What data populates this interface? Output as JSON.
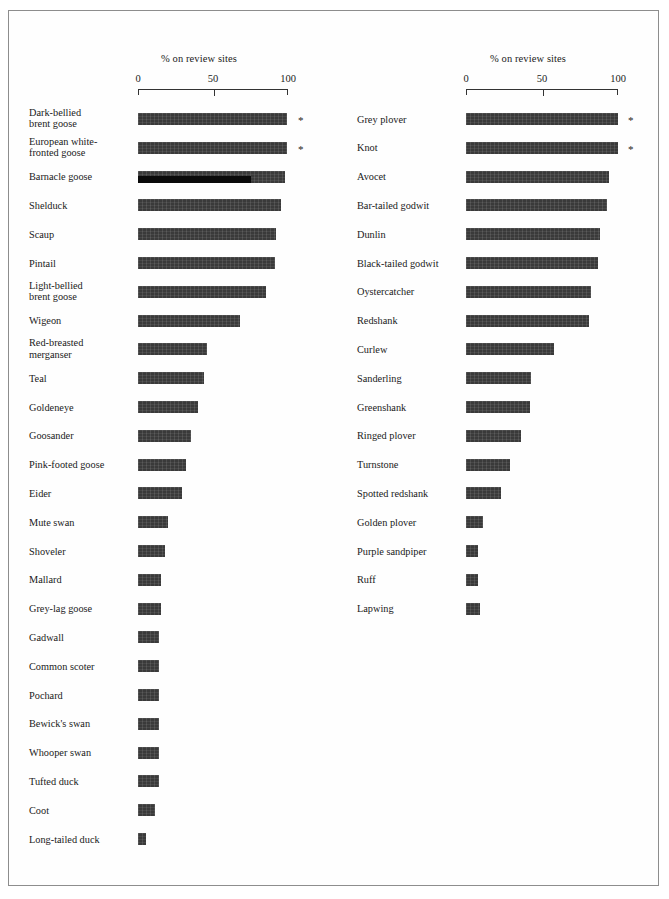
{
  "figure": {
    "background_color": "#ffffff",
    "frame_color": "#8d8d8d",
    "bar_color": "#3a3a3a",
    "bar_color_dark": "#0a0a0a",
    "footnote_marker": "*"
  },
  "chart_data": [
    {
      "type": "bar",
      "orientation": "horizontal",
      "title": "% on review sites",
      "xlabel": "% on review sites",
      "ylabel": "",
      "xlim": [
        0,
        100
      ],
      "xticks": [
        0,
        50,
        100
      ],
      "xticklabels": [
        "0",
        "50",
        "100"
      ],
      "grid": false,
      "legend": "none",
      "panel": "left",
      "panel_name": "Wildfowl",
      "categories": [
        "Dark-bellied\nbrent goose",
        "European white-\nfronted goose",
        "Barnacle goose",
        "Shelduck",
        "Scaup",
        "Pintail",
        "Light-bellied\nbrent goose",
        "Wigeon",
        "Red-breasted\nmerganser",
        "Teal",
        "Goldeneye",
        "Goosander",
        "Pink-footed goose",
        "Eider",
        "Mute swan",
        "Shoveler",
        "Mallard",
        "Grey-lag goose",
        "Gadwall",
        "Common scoter",
        "Pochard",
        "Bewick's swan",
        "Whooper swan",
        "Tufted duck",
        "Coot",
        "Long-tailed duck"
      ],
      "values": [
        99,
        99,
        98,
        95,
        92,
        91,
        85,
        68,
        46,
        44,
        40,
        35,
        32,
        29,
        20,
        18,
        15,
        15,
        14,
        14,
        14,
        14,
        14,
        14,
        11,
        5
      ],
      "annotations": [
        {
          "category": "Dark-bellied\nbrent goose",
          "marker": "*"
        },
        {
          "category": "European white-\nfronted goose",
          "marker": "*"
        }
      ],
      "overlay_bars": [
        {
          "category": "Barnacle goose",
          "value": 75,
          "color": "#0a0a0a"
        }
      ]
    },
    {
      "type": "bar",
      "orientation": "horizontal",
      "title": "% on review sites",
      "xlabel": "% on review sites",
      "ylabel": "",
      "xlim": [
        0,
        100
      ],
      "xticks": [
        0,
        50,
        100
      ],
      "xticklabels": [
        "0",
        "50",
        "100"
      ],
      "grid": false,
      "legend": "none",
      "panel": "right",
      "panel_name": "Waders",
      "categories": [
        "Grey plover",
        "Knot",
        "Avocet",
        "Bar-tailed godwit",
        "Dunlin",
        "Black-tailed godwit",
        "Oystercatcher",
        "Redshank",
        "Curlew",
        "Sanderling",
        "Greenshank",
        "Ringed plover",
        "Turnstone",
        "Spotted redshank",
        "Golden plover",
        "Purple sandpiper",
        "Ruff",
        "Lapwing"
      ],
      "values": [
        100,
        100,
        94,
        93,
        88,
        87,
        82,
        81,
        58,
        43,
        42,
        36,
        29,
        23,
        11,
        8,
        8,
        9
      ],
      "annotations": [
        {
          "category": "Grey plover",
          "marker": "*"
        },
        {
          "category": "Knot",
          "marker": "*"
        }
      ],
      "overlay_bars": []
    }
  ],
  "panels": {
    "left": {
      "axis_title": "% on review sites",
      "ticks": [
        {
          "label": "0",
          "value": 0
        },
        {
          "label": "50",
          "value": 50
        },
        {
          "label": "100",
          "value": 100
        }
      ]
    },
    "right": {
      "axis_title": "% on review sites",
      "ticks": [
        {
          "label": "0",
          "value": 0
        },
        {
          "label": "50",
          "value": 50
        },
        {
          "label": "100",
          "value": 100
        }
      ]
    }
  }
}
